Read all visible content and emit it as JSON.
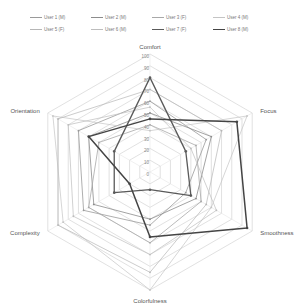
{
  "chart_data": {
    "type": "radar",
    "title": "",
    "axes": [
      "Comfort",
      "Focus",
      "Smoothness",
      "Colorfulness",
      "Complexity",
      "Orientation"
    ],
    "ticks": [
      0,
      10,
      20,
      30,
      40,
      50,
      60,
      70,
      80,
      90,
      100
    ],
    "range": [
      0,
      100
    ],
    "grid": true,
    "legend_position": "top",
    "series": [
      {
        "name": "User 1 (M)",
        "values": [
          60,
          55,
          35,
          45,
          65,
          70
        ],
        "color": "#9a9a9a",
        "width": 0.8
      },
      {
        "name": "User 2 (M)",
        "values": [
          50,
          60,
          45,
          40,
          55,
          60
        ],
        "color": "#8c8c8c",
        "width": 0.8
      },
      {
        "name": "User 3 (F)",
        "values": [
          40,
          45,
          50,
          60,
          60,
          50
        ],
        "color": "#a8a8a8",
        "width": 0.8
      },
      {
        "name": "User 4 (M)",
        "values": [
          35,
          95,
          60,
          100,
          85,
          95
        ],
        "color": "#c4c4c4",
        "width": 0.7
      },
      {
        "name": "User 5 (F)",
        "values": [
          70,
          70,
          55,
          85,
          90,
          90
        ],
        "color": "#b6b6b6",
        "width": 0.7
      },
      {
        "name": "User 6 (M)",
        "values": [
          55,
          40,
          65,
          70,
          75,
          80
        ],
        "color": "#bdbdbd",
        "width": 0.7
      },
      {
        "name": "User 7 (F)",
        "values": [
          80,
          35,
          40,
          15,
          35,
          35
        ],
        "color": "#5a5a5a",
        "width": 1.3
      },
      {
        "name": "User 8 (M)",
        "values": [
          45,
          85,
          95,
          55,
          20,
          60
        ],
        "color": "#444444",
        "width": 1.5
      }
    ]
  },
  "legend": {
    "items": [
      {
        "label": "User 1 (M)"
      },
      {
        "label": "User 2 (M)"
      },
      {
        "label": "User 3 (F)"
      },
      {
        "label": "User 4 (M)"
      },
      {
        "label": "User 5 (F)"
      },
      {
        "label": "User 6 (M)"
      },
      {
        "label": "User 7 (F)"
      },
      {
        "label": "User 8 (M)"
      }
    ]
  }
}
